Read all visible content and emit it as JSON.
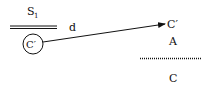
{
  "diagram": {
    "labels": {
      "s1": "S",
      "s1_sub": "1",
      "d": "d",
      "circle_label": "C′",
      "target_label": "C′",
      "a_label": "A",
      "c_label": "C"
    },
    "colors": {
      "stroke": "#111111",
      "background": "#ffffff"
    }
  }
}
